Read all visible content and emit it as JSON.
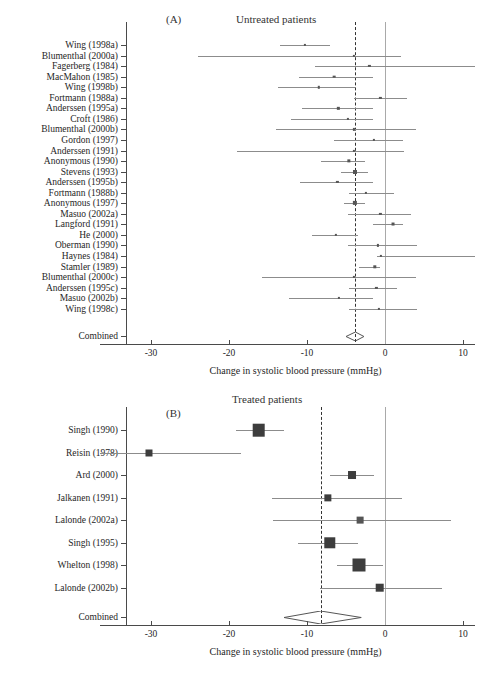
{
  "figure": {
    "xaxis_title": "Change in systolic blood pressure (mmHg)",
    "xticks": [
      -30,
      -20,
      -10,
      0,
      10
    ],
    "xtick_labels": [
      "-30",
      "-20",
      "-10",
      "0",
      "10"
    ],
    "xlim": [
      -36.5,
      11.5
    ],
    "combined_label": "Combined"
  },
  "panelA": {
    "letter": "(A)",
    "title": "Untreated patients",
    "ref_zero": 0,
    "ref_pooled": -3.8
  },
  "panelB": {
    "letter": "(B)",
    "title": "Treated patients",
    "ref_zero": 0,
    "ref_pooled": -8.2
  },
  "chart_data": [
    {
      "type": "forest",
      "panel": "A",
      "title": "Untreated patients",
      "xlabel": "Change in systolic blood pressure (mmHg)",
      "xlim": [
        -36.5,
        11.5
      ],
      "xticks": [
        -30,
        -20,
        -10,
        0,
        10
      ],
      "null_line": 0,
      "pooled_line": -3.8,
      "studies": [
        {
          "label": "Wing (1998a)",
          "estimate": -10.3,
          "low": -13.4,
          "high": -7.0,
          "weight": 1.1
        },
        {
          "label": "Blumenthal (2000a)",
          "estimate": -4.0,
          "low": -24.0,
          "high": 2.0,
          "weight": 0.6
        },
        {
          "label": "Fagerberg (1984)",
          "estimate": -2.0,
          "low": -9.0,
          "high": 11.5,
          "weight": 0.6
        },
        {
          "label": "MacMahon (1985)",
          "estimate": -6.5,
          "low": -11.0,
          "high": -1.5,
          "weight": 2.0
        },
        {
          "label": "Wing (1998b)",
          "estimate": -8.5,
          "low": -13.7,
          "high": -3.9,
          "weight": 1.6
        },
        {
          "label": "Fortmann (1988a)",
          "estimate": -0.6,
          "low": -4.0,
          "high": 2.8,
          "weight": 0.9
        },
        {
          "label": "Anderssen (1995a)",
          "estimate": -6.0,
          "low": -10.7,
          "high": -1.6,
          "weight": 1.5
        },
        {
          "label": "Croft (1986)",
          "estimate": -4.8,
          "low": -12.0,
          "high": -1.6,
          "weight": 1.0
        },
        {
          "label": "Blumenthal (2000b)",
          "estimate": -4.0,
          "low": -14.0,
          "high": 4.0,
          "weight": 0.6
        },
        {
          "label": "Gordon (1997)",
          "estimate": -1.4,
          "low": -6.6,
          "high": 2.3,
          "weight": 0.8
        },
        {
          "label": "Anderssen (1991)",
          "estimate": -4.0,
          "low": -19.0,
          "high": 2.4,
          "weight": 0.6
        },
        {
          "label": "Anonymous (1990)",
          "estimate": -4.6,
          "low": -8.2,
          "high": -2.6,
          "weight": 3.0
        },
        {
          "label": "Stevens (1993)",
          "estimate": -3.9,
          "low": -5.7,
          "high": -2.2,
          "weight": 4.5
        },
        {
          "label": "Anderssen (1995b)",
          "estimate": -6.1,
          "low": -10.9,
          "high": -1.6,
          "weight": 0.9
        },
        {
          "label": "Fortmann (1988b)",
          "estimate": -2.4,
          "low": -4.6,
          "high": 1.1,
          "weight": 0.9
        },
        {
          "label": "Anonymous (1997)",
          "estimate": -3.9,
          "low": -5.3,
          "high": -2.6,
          "weight": 5.0
        },
        {
          "label": "Masuo (2002a)",
          "estimate": -0.6,
          "low": -4.7,
          "high": 3.3,
          "weight": 0.9
        },
        {
          "label": "Langford (1991)",
          "estimate": 1.0,
          "low": -1.6,
          "high": 2.3,
          "weight": 2.4
        },
        {
          "label": "He (2000)",
          "estimate": -6.3,
          "low": -9.4,
          "high": -3.5,
          "weight": 1.4
        },
        {
          "label": "Oberman (1990)",
          "estimate": -0.9,
          "low": -4.7,
          "high": 4.1,
          "weight": 0.9
        },
        {
          "label": "Haynes (1984)",
          "estimate": -0.5,
          "low": -1.0,
          "high": 11.5,
          "weight": 0.7
        },
        {
          "label": "Stamler (1989)",
          "estimate": -1.3,
          "low": -3.3,
          "high": -0.6,
          "weight": 3.2
        },
        {
          "label": "Blumenthal (2000c)",
          "estimate": -4.0,
          "low": -15.8,
          "high": 4.0,
          "weight": 0.6
        },
        {
          "label": "Anderssen (1995c)",
          "estimate": -1.1,
          "low": -4.6,
          "high": 1.6,
          "weight": 0.9
        },
        {
          "label": "Masuo (2002b)",
          "estimate": -5.9,
          "low": -12.3,
          "high": -1.6,
          "weight": 0.9
        },
        {
          "label": "Wing (1998c)",
          "estimate": -0.8,
          "low": -4.6,
          "high": 4.1,
          "weight": 0.8
        }
      ],
      "combined": {
        "label": "Combined",
        "estimate": -3.8,
        "low": -5.0,
        "high": -2.7
      }
    },
    {
      "type": "forest",
      "panel": "B",
      "title": "Treated patients",
      "xlabel": "Change in systolic blood pressure (mmHg)",
      "xlim": [
        -36.5,
        11.5
      ],
      "xticks": [
        -30,
        -20,
        -10,
        0,
        10
      ],
      "null_line": 0,
      "pooled_line": -8.2,
      "studies": [
        {
          "label": "Singh (1990)",
          "estimate": -16.2,
          "low": -19.1,
          "high": -12.9,
          "weight": 9.0
        },
        {
          "label": "Reisin (1978)",
          "estimate": -30.3,
          "low": -36.5,
          "high": -18.5,
          "weight": 2.8
        },
        {
          "label": "Ard (2000)",
          "estimate": -4.2,
          "low": -7.0,
          "high": -1.4,
          "weight": 3.6
        },
        {
          "label": "Jalkanen (1991)",
          "estimate": -7.3,
          "low": -14.5,
          "high": 2.2,
          "weight": 3.0
        },
        {
          "label": "Lalonde (2002a)",
          "estimate": -3.2,
          "low": -14.3,
          "high": 8.5,
          "weight": 2.6
        },
        {
          "label": "Singh (1995)",
          "estimate": -7.1,
          "low": -11.1,
          "high": -3.4,
          "weight": 7.4
        },
        {
          "label": "Whelton (1998)",
          "estimate": -3.3,
          "low": -6.2,
          "high": -0.2,
          "weight": 9.6
        },
        {
          "label": "Lalonde (2002b)",
          "estimate": -0.7,
          "low": -8.3,
          "high": 7.3,
          "weight": 4.2
        }
      ],
      "combined": {
        "label": "Combined",
        "estimate": -8.2,
        "low": -12.9,
        "high": -3.0
      }
    }
  ]
}
